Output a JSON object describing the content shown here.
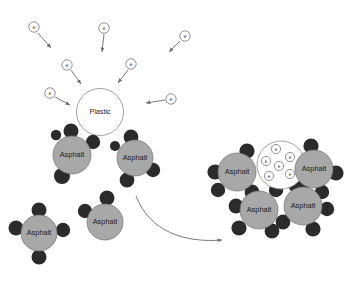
{
  "canvas": {
    "width": 358,
    "height": 282,
    "background": "#ffffff"
  },
  "colors": {
    "asphalt_fill": "#a8a8a8",
    "asphalt_stroke": "#6f6f6f",
    "satellite_dot": "#2b2b2b",
    "plastic_fill": "#ffffff",
    "plastic_stroke": "#8a8a8a",
    "electron_stroke": "#5a5a5a",
    "electron_fill": "#ffffff",
    "arrow_color": "#6b6b6b",
    "text_color": "#1c1c1c"
  },
  "labels": {
    "asphalt": "Asphalt",
    "plastic": "Plastic",
    "electron": "e"
  },
  "stage_before": {
    "name": "uncharged-plastic-with-free-electrons",
    "plastic_particle": {
      "label": "Plastic",
      "cx": 100,
      "cy": 112,
      "r": 23.5,
      "electrons_inside": 0
    },
    "free_electrons": [
      {
        "id": "e1",
        "cx": 34,
        "cy": 27,
        "r": 5.2,
        "arrow": {
          "x1": 38,
          "y1": 33,
          "x2": 51,
          "y2": 48
        }
      },
      {
        "id": "e2",
        "cx": 104,
        "cy": 28,
        "r": 5.2,
        "arrow": {
          "x1": 104,
          "y1": 34,
          "x2": 102,
          "y2": 52
        }
      },
      {
        "id": "e3",
        "cx": 185,
        "cy": 36,
        "r": 5.2,
        "arrow": {
          "x1": 180,
          "y1": 41,
          "x2": 169,
          "y2": 52
        }
      },
      {
        "id": "e4",
        "cx": 67,
        "cy": 65,
        "r": 5.2,
        "arrow": {
          "x1": 71,
          "y1": 70,
          "x2": 81,
          "y2": 84
        }
      },
      {
        "id": "e5",
        "cx": 131,
        "cy": 64,
        "r": 5.2,
        "arrow": {
          "x1": 128,
          "y1": 70,
          "x2": 118,
          "y2": 83
        }
      },
      {
        "id": "e6",
        "cx": 50,
        "cy": 93,
        "r": 5.2,
        "arrow": {
          "x1": 55,
          "y1": 97,
          "x2": 70,
          "y2": 105
        }
      },
      {
        "id": "e7",
        "cx": 171,
        "cy": 99,
        "r": 5.2,
        "arrow": {
          "x1": 165,
          "y1": 100,
          "x2": 146,
          "y2": 103
        }
      }
    ],
    "asphalt_particles": [
      {
        "id": "a1",
        "label": "Asphalt",
        "cx": 72,
        "cy": 155,
        "r": 19,
        "dots": [
          {
            "cx": 71,
            "cy": 131,
            "r": 7.5
          },
          {
            "cx": 93,
            "cy": 142,
            "r": 7.2
          },
          {
            "cx": 62,
            "cy": 176,
            "r": 8.0
          },
          {
            "cx": 56,
            "cy": 135,
            "r": 5.2
          }
        ]
      },
      {
        "id": "a2",
        "label": "Asphalt",
        "cx": 135,
        "cy": 158,
        "r": 18,
        "dots": [
          {
            "cx": 131,
            "cy": 137,
            "r": 7.4
          },
          {
            "cx": 153,
            "cy": 170,
            "r": 7.2
          },
          {
            "cx": 127,
            "cy": 180,
            "r": 7.4
          },
          {
            "cx": 115,
            "cy": 146,
            "r": 5.0
          }
        ]
      },
      {
        "id": "a3",
        "label": "Asphalt",
        "cx": 39,
        "cy": 233,
        "r": 18,
        "dots": [
          {
            "cx": 39,
            "cy": 210,
            "r": 7.5
          },
          {
            "cx": 16,
            "cy": 228,
            "r": 7.5
          },
          {
            "cx": 63,
            "cy": 230,
            "r": 7.2
          },
          {
            "cx": 39,
            "cy": 257,
            "r": 7.5
          }
        ]
      },
      {
        "id": "a4",
        "label": "Asphalt",
        "cx": 105,
        "cy": 222,
        "r": 18,
        "dots": [
          {
            "cx": 107,
            "cy": 198,
            "r": 7.5
          },
          {
            "cx": 85,
            "cy": 211,
            "r": 7.2
          }
        ]
      }
    ]
  },
  "process_arrow": {
    "name": "transition-arrow",
    "path": "M 136 196 C 150 232 185 243 222 240",
    "head": {
      "x": 224,
      "y": 240
    }
  },
  "stage_after": {
    "name": "charged-plastic-coated-by-asphalt",
    "plastic_particle": {
      "label": "",
      "cx": 281,
      "cy": 165,
      "r": 24,
      "electrons_inside": 6
    },
    "inner_electrons": [
      {
        "id": "ie1",
        "cx": 276,
        "cy": 149,
        "r": 4.6
      },
      {
        "id": "ie2",
        "cx": 290,
        "cy": 157,
        "r": 4.6
      },
      {
        "id": "ie3",
        "cx": 266,
        "cy": 161,
        "r": 4.6
      },
      {
        "id": "ie4",
        "cx": 279,
        "cy": 166,
        "r": 4.6
      },
      {
        "id": "ie5",
        "cx": 269,
        "cy": 176,
        "r": 4.6
      },
      {
        "id": "ie6",
        "cx": 290,
        "cy": 174,
        "r": 4.6
      }
    ],
    "asphalt_particles": [
      {
        "id": "b1",
        "label": "Asphalt",
        "cx": 237,
        "cy": 172,
        "r": 19,
        "dots": [
          {
            "cx": 247,
            "cy": 151,
            "r": 7.6
          },
          {
            "cx": 215,
            "cy": 172,
            "r": 7.6
          },
          {
            "cx": 218,
            "cy": 190,
            "r": 7.2
          },
          {
            "cx": 252,
            "cy": 192,
            "r": 7.4
          }
        ]
      },
      {
        "id": "b2",
        "label": "Asphalt",
        "cx": 314,
        "cy": 169,
        "r": 19,
        "dots": [
          {
            "cx": 311,
            "cy": 146,
            "r": 7.6
          },
          {
            "cx": 336,
            "cy": 173,
            "r": 7.6
          },
          {
            "cx": 296,
            "cy": 186,
            "r": 7.2
          },
          {
            "cx": 322,
            "cy": 192,
            "r": 7.2
          }
        ]
      },
      {
        "id": "b3",
        "label": "Asphalt",
        "cx": 259,
        "cy": 210,
        "r": 19,
        "dots": [
          {
            "cx": 236,
            "cy": 206,
            "r": 7.4
          },
          {
            "cx": 239,
            "cy": 228,
            "r": 7.6
          },
          {
            "cx": 272,
            "cy": 231,
            "r": 7.4
          },
          {
            "cx": 276,
            "cy": 190,
            "r": 7.2
          }
        ]
      },
      {
        "id": "b4",
        "label": "Asphalt",
        "cx": 303,
        "cy": 206,
        "r": 19,
        "dots": [
          {
            "cx": 283,
            "cy": 222,
            "r": 7.4
          },
          {
            "cx": 313,
            "cy": 229,
            "r": 7.6
          },
          {
            "cx": 327,
            "cy": 209,
            "r": 7.2
          },
          {
            "cx": 303,
            "cy": 184,
            "r": 6.4
          }
        ]
      }
    ]
  }
}
